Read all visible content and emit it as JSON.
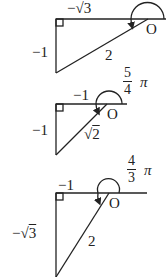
{
  "diagrams": [
    {
      "name": "triangle-1",
      "top_label": "−√3",
      "left_label": "−1",
      "hyp_label": "2",
      "origin_label": "O"
    },
    {
      "name": "triangle-2",
      "angle_num": "5",
      "angle_den": "4",
      "angle_pi": "π",
      "top_label": "−1",
      "left_label": "−1",
      "hyp_label_sqrt": "√",
      "hyp_label_val": "2",
      "origin_label": "O"
    },
    {
      "name": "triangle-3",
      "angle_num": "4",
      "angle_den": "3",
      "angle_pi": "π",
      "top_label": "−1",
      "left_label_minus": "−",
      "left_label_sqrt": "√",
      "left_label_val": "3",
      "hyp_label": "2",
      "origin_label": "O"
    }
  ],
  "colors": {
    "stroke": "#222222",
    "background": "#ffffff"
  }
}
